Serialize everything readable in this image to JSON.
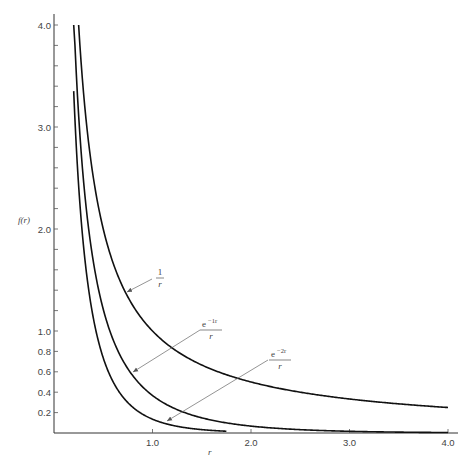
{
  "chart_data": {
    "type": "line",
    "title": "",
    "xlabel": "r",
    "ylabel": "f(r)",
    "xlim": [
      0,
      4.0
    ],
    "ylim": [
      0,
      4.0
    ],
    "grid": false,
    "x_ticks": [
      1.0,
      2.0,
      3.0,
      4.0
    ],
    "x_tick_labels": [
      "1.0",
      "2.0",
      "3.0",
      "4.0"
    ],
    "y_ticks_labeled": [
      0.2,
      0.4,
      0.6,
      0.8,
      1.0,
      2.0,
      3.0,
      4.0
    ],
    "y_tick_labels": [
      "0.2",
      "0.4",
      "0.6",
      "0.8",
      "1.0",
      "2.0",
      "3.0",
      "4.0"
    ],
    "y_minor_tick_step": 0.2,
    "series": [
      {
        "name": "1/r",
        "label_num": "1",
        "label_den": "r",
        "formula": "1/r",
        "r_start": 0.25,
        "r_end": 4.0,
        "x": [
          0.25,
          0.5,
          0.75,
          1.0,
          1.5,
          2.0,
          2.5,
          3.0,
          3.5,
          4.0
        ],
        "values": [
          4.0,
          2.0,
          1.33,
          1.0,
          0.67,
          0.5,
          0.4,
          0.33,
          0.29,
          0.25
        ]
      },
      {
        "name": "e^{-1r}/r",
        "label_num": "e",
        "label_sup": "−1r",
        "label_den": "r",
        "formula": "exp(-r)/r",
        "r_start": 0.2,
        "r_end": 4.0,
        "x": [
          0.2,
          0.5,
          0.75,
          1.0,
          1.5,
          2.0,
          2.5,
          3.0,
          3.5,
          4.0
        ],
        "values": [
          4.09,
          1.21,
          0.63,
          0.37,
          0.15,
          0.07,
          0.03,
          0.02,
          0.01,
          0.005
        ]
      },
      {
        "name": "e^{-2r}/r",
        "label_num": "e",
        "label_sup": "−2r",
        "label_den": "r",
        "formula": "exp(-2r)/r",
        "r_start": 0.2,
        "r_end": 1.75,
        "x": [
          0.2,
          0.3,
          0.5,
          0.75,
          1.0,
          1.25,
          1.5,
          1.75
        ],
        "values": [
          3.35,
          1.83,
          0.74,
          0.3,
          0.14,
          0.07,
          0.03,
          0.02
        ]
      }
    ],
    "annotations": [
      {
        "text": "1/r",
        "label_pos": [
          160,
          278
        ],
        "arrow_from": [
          152,
          279
        ],
        "arrow_to": [
          127,
          292
        ]
      },
      {
        "text": "e^{-1r}/r",
        "label_pos": [
          211,
          330
        ],
        "arrow_from": [
          200,
          330
        ],
        "arrow_to": [
          133,
          372
        ]
      },
      {
        "text": "e^{-2r}/r",
        "label_pos": [
          280,
          360
        ],
        "arrow_from": [
          268,
          360
        ],
        "arrow_to": [
          167,
          421
        ]
      }
    ]
  },
  "axes": {
    "x_label": "r",
    "y_label": "f(r)"
  }
}
